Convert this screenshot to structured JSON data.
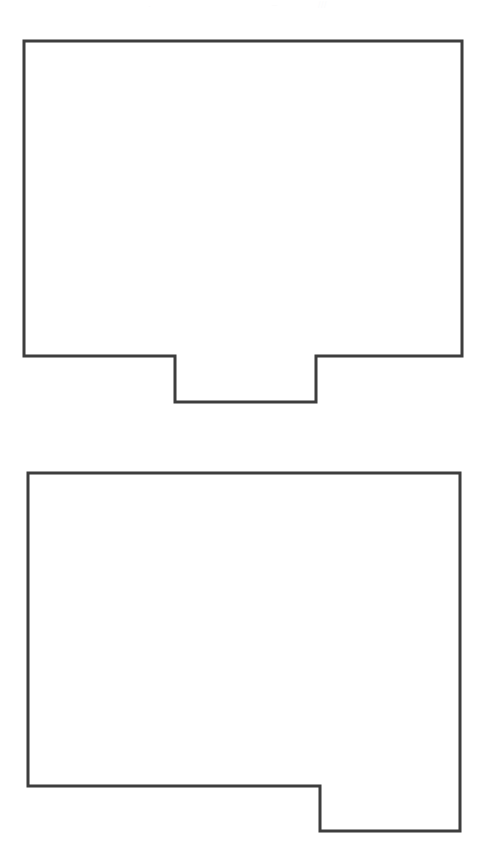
{
  "page": {
    "background_color": "#ffffff",
    "width": 488,
    "height": 842
  },
  "style": {
    "stroke_color": "#3d3d3d",
    "fill_color": "#ffffff",
    "stroke_width": 3,
    "ghost_color": "#fbfbfc"
  },
  "ghost_marks": [
    {
      "text": "·",
      "x": 148,
      "y": 1
    },
    {
      "text": "–",
      "x": 272,
      "y": 0
    },
    {
      "text": "///",
      "x": 318,
      "y": 0
    }
  ],
  "shapes": [
    {
      "id": "shape-top",
      "label": "Top outlined rectangle with bottom tab",
      "points": "24,41 462,41 462,356 316,356 316,402 175,402 175,356 24,356",
      "body": {
        "x": 24,
        "y": 41,
        "width": 438,
        "height": 315
      },
      "tab": {
        "x": 175,
        "y": 356,
        "width": 141,
        "height": 46,
        "position": "bottom-center"
      }
    },
    {
      "id": "shape-bottom",
      "label": "Bottom outlined rectangle with bottom-right tab",
      "points": "28,473 460,473 460,831 320,831 320,786 28,786",
      "body": {
        "x": 28,
        "y": 473,
        "width": 432,
        "height": 313
      },
      "tab": {
        "x": 320,
        "y": 786,
        "width": 140,
        "height": 45,
        "position": "bottom-right"
      }
    }
  ]
}
